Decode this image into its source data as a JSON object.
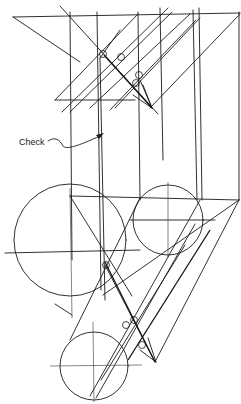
{
  "figure": {
    "type": "descriptive-geometry construction drawing",
    "annotations": [
      {
        "id": "check",
        "text": "Check",
        "x": 19,
        "y": 145
      }
    ],
    "colors": {
      "ink": "#1a1a1a",
      "paper": "#ffffff"
    }
  }
}
